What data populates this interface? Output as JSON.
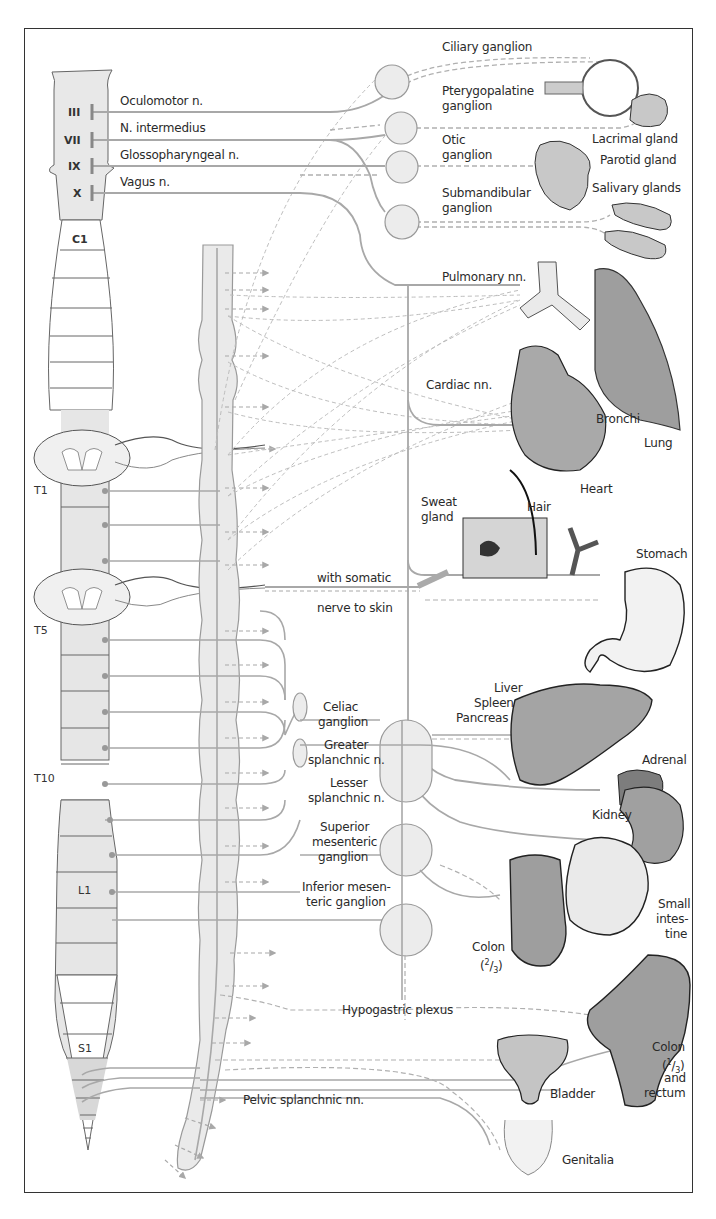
{
  "figure": {
    "colors": {
      "frame": "#333333",
      "nerve": "#a8a8a8",
      "segment_fill": "#e6e6e6",
      "organ_fill": "#b5b5b5",
      "ganglion_fill": "#ececec"
    }
  },
  "cranial_nerves": [
    {
      "numeral": "III",
      "label": "Oculomotor n."
    },
    {
      "numeral": "VII",
      "label": "N. intermedius"
    },
    {
      "numeral": "IX",
      "label": "Glossopharyngeal n."
    },
    {
      "numeral": "X",
      "label": "Vagus n."
    }
  ],
  "spinal_segments": {
    "c1": "C1",
    "t1": "T1",
    "t5": "T5",
    "t10": "T10",
    "l1": "L1",
    "s1": "S1"
  },
  "head_ganglia": {
    "ciliary": "Ciliary ganglion",
    "pterygopalatine_1": "Pterygopalatine",
    "pterygopalatine_2": "ganglion",
    "otic_1": "Otic",
    "otic_2": "ganglion",
    "submandibular_1": "Submandibular",
    "submandibular_2": "ganglion"
  },
  "head_organs": {
    "lacrimal": "Lacrimal gland",
    "parotid": "Parotid gland",
    "salivary": "Salivary glands"
  },
  "thoracic": {
    "pulmonary": "Pulmonary nn.",
    "cardiac": "Cardiac nn.",
    "bronchi": "Bronchi",
    "lung": "Lung",
    "heart": "Heart"
  },
  "skin": {
    "sweat_1": "Sweat",
    "sweat_2": "gland",
    "hair": "Hair",
    "somatic_1": "with somatic",
    "somatic_2": "nerve to skin"
  },
  "abdominal": {
    "stomach": "Stomach",
    "liver": "Liver",
    "spleen": "Spleen",
    "pancreas": "Pancreas",
    "celiac_1": "Celiac",
    "celiac_2": "ganglion",
    "greater_1": "Greater",
    "greater_2": "splanchnic n.",
    "lesser_1": "Lesser",
    "lesser_2": "splanchnic n.",
    "adrenal": "Adrenal",
    "kidney": "Kidney",
    "sup_mes_1": "Superior",
    "sup_mes_2": "mesenteric",
    "sup_mes_3": "ganglion",
    "inf_mes_1": "Inferior mesen-",
    "inf_mes_2": "teric ganglion",
    "small_int_1": "Small",
    "small_int_2": "intes-",
    "small_int_3": "tine",
    "colon23_1": "Colon",
    "colon23_num": "2",
    "colon23_den": "3"
  },
  "pelvic": {
    "hypogastric": "Hypogastric plexus",
    "pelvic_splanchnic": "Pelvic splanchnic nn.",
    "bladder": "Bladder",
    "colon13_1": "Colon",
    "colon13_num": "1",
    "colon13_den": "3",
    "colon13_and": "and",
    "colon13_rectum": "rectum",
    "genitalia": "Genitalia"
  }
}
